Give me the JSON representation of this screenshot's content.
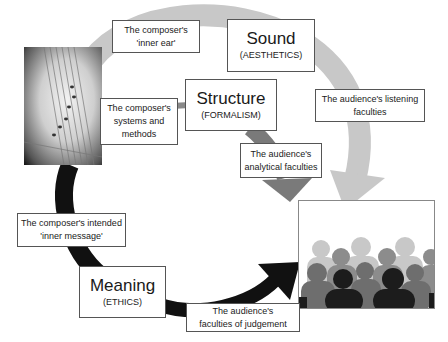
{
  "diagram": {
    "nodes": {
      "sound": {
        "title": "Sound",
        "subtitle": "(AESTHETICS)"
      },
      "structure": {
        "title": "Structure",
        "subtitle": "(FORMALISM)"
      },
      "meaning": {
        "title": "Meaning",
        "subtitle": "(ETHICS)"
      }
    },
    "labels": {
      "inner_ear": {
        "line1": "The composer's",
        "line2": "'inner ear'"
      },
      "systems": {
        "line1": "The composer's",
        "line2": "systems and",
        "line3": "methods"
      },
      "listening": {
        "line1": "The audience's listening",
        "line2": "faculties"
      },
      "analytical": {
        "line1": "The audience's",
        "line2": "analytical faculties"
      },
      "inner_message": {
        "line1": "The composer's intended",
        "line2": "'inner message'"
      },
      "judgement": {
        "line1": "The audience's",
        "line2": "faculties of judgement"
      }
    },
    "images": {
      "composer": "sheet-music-photo",
      "audience": "audience-silhouettes"
    },
    "colors": {
      "sound_arrow": "#c8c8c8",
      "structure_arrow": "#7a7a7a",
      "meaning_arrow": "#111111",
      "box_border": "#555555"
    }
  }
}
